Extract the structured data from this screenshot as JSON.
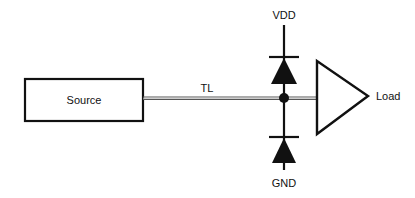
{
  "diagram": {
    "type": "circuit-schematic",
    "colors": {
      "stroke": "#111111",
      "line_gray": "#8a8a8a",
      "background": "#ffffff"
    },
    "source": {
      "label": "Source"
    },
    "transmission_line": {
      "label": "TL"
    },
    "supply": {
      "label": "VDD"
    },
    "ground": {
      "label": "GND"
    },
    "load": {
      "label": "Load"
    },
    "components": [
      {
        "id": "source-block",
        "kind": "block",
        "label": "Source"
      },
      {
        "id": "tl",
        "kind": "transmission-line",
        "label": "TL"
      },
      {
        "id": "diode-vdd",
        "kind": "clamp-diode",
        "to": "VDD"
      },
      {
        "id": "diode-gnd",
        "kind": "clamp-diode",
        "to": "GND"
      },
      {
        "id": "load-buffer",
        "kind": "buffer-triangle",
        "label": "Load"
      }
    ]
  }
}
